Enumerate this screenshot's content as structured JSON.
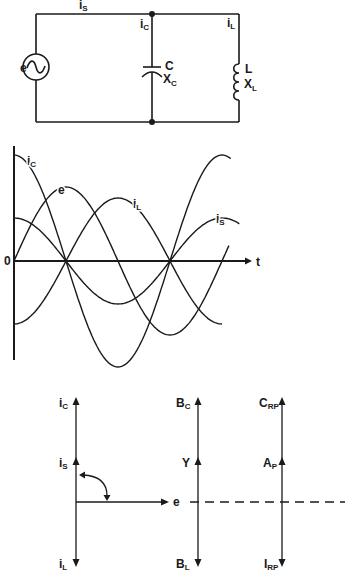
{
  "circuit": {
    "source": {
      "label": "e",
      "icon": "ac-sine-source-icon"
    },
    "currents": {
      "source": {
        "main": "i",
        "sub": "S"
      },
      "capacitor": {
        "main": "i",
        "sub": "C"
      },
      "inductor": {
        "main": "i",
        "sub": "L"
      }
    },
    "capacitor": {
      "name": "C",
      "reactance": {
        "main": "X",
        "sub": "C"
      }
    },
    "inductor": {
      "name": "L",
      "reactance": {
        "main": "X",
        "sub": "L"
      }
    }
  },
  "waveform_graph": {
    "type": "line",
    "origin_label": "0",
    "x_axis_label": "t",
    "y_axis_label": "",
    "zero_crossings_of_currents_deg": [
      90,
      270
    ],
    "series": [
      {
        "name": "e",
        "label": {
          "main": "e",
          "sub": ""
        },
        "amplitude": 74,
        "phase_deg": 0,
        "t_end_deg": 374
      },
      {
        "name": "iC",
        "label": {
          "main": "i",
          "sub": "C"
        },
        "amplitude": 106,
        "phase_deg": 90,
        "t_end_deg": 377
      },
      {
        "name": "iL",
        "label": {
          "main": "i",
          "sub": "L"
        },
        "amplitude": 63,
        "phase_deg": -90,
        "t_end_deg": 360
      },
      {
        "name": "iS",
        "label": {
          "main": "i",
          "sub": "S"
        },
        "amplitude": 43,
        "phase_deg": 90,
        "t_end_deg": 391
      }
    ]
  },
  "phasor_diagrams": {
    "current": {
      "top": {
        "main": "i",
        "sub": "C"
      },
      "middle": {
        "main": "i",
        "sub": "S"
      },
      "bottom": {
        "main": "i",
        "sub": "L"
      },
      "reference": {
        "main": "e",
        "sub": ""
      },
      "angle_marker": "90-degree-arc"
    },
    "admittance": {
      "top": {
        "main": "B",
        "sub": "C"
      },
      "middle": {
        "main": "Y",
        "sub": ""
      },
      "bottom": {
        "main": "B",
        "sub": "L"
      }
    },
    "power": {
      "top": {
        "main": "C",
        "sub": "RP"
      },
      "middle": {
        "main": "A",
        "sub": "P"
      },
      "bottom": {
        "main": "I",
        "sub": "RP"
      }
    }
  }
}
